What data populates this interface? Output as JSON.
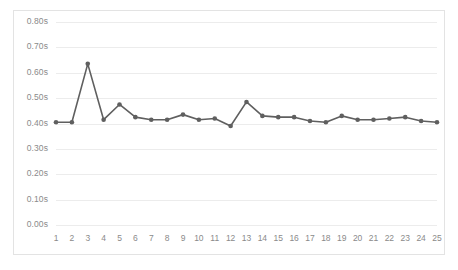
{
  "chart_data": {
    "type": "line",
    "title": "",
    "subtitle": "",
    "xlabel": "",
    "ylabel": "",
    "categories": [
      "1",
      "2",
      "3",
      "4",
      "5",
      "6",
      "7",
      "8",
      "9",
      "10",
      "11",
      "12",
      "13",
      "14",
      "15",
      "16",
      "17",
      "18",
      "19",
      "20",
      "21",
      "22",
      "23",
      "24",
      "25"
    ],
    "values": [
      0.405,
      0.405,
      0.635,
      0.415,
      0.475,
      0.425,
      0.415,
      0.415,
      0.435,
      0.415,
      0.42,
      0.39,
      0.485,
      0.43,
      0.425,
      0.425,
      0.41,
      0.405,
      0.43,
      0.415,
      0.415,
      0.42,
      0.425,
      0.41,
      0.405
    ],
    "value_suffix": "s",
    "ylim": [
      0.0,
      0.8
    ],
    "ytick_values": [
      0.0,
      0.1,
      0.2,
      0.3,
      0.4,
      0.5,
      0.6,
      0.7,
      0.8
    ],
    "ytick_labels": [
      "0.00s",
      "0.10s",
      "0.20s",
      "0.30s",
      "0.40s",
      "0.50s",
      "0.60s",
      "0.70s",
      "0.80s"
    ],
    "grid": true,
    "grid_axis": "y",
    "legend": false,
    "legend_position": "none",
    "series": [
      {
        "name": "",
        "line_color": "#5f5f5f",
        "marker": "circle",
        "marker_color": "#5f5f5f",
        "values": [
          0.405,
          0.405,
          0.635,
          0.415,
          0.475,
          0.425,
          0.415,
          0.415,
          0.435,
          0.415,
          0.42,
          0.39,
          0.485,
          0.43,
          0.425,
          0.425,
          0.41,
          0.405,
          0.43,
          0.415,
          0.415,
          0.42,
          0.425,
          0.41,
          0.405
        ]
      }
    ]
  },
  "style": {
    "background": "#ffffff",
    "border_color": "#e3e3e3",
    "grid_color": "#ececec",
    "tick_label_color": "#8a8a8a",
    "series_color": "#5f5f5f"
  }
}
